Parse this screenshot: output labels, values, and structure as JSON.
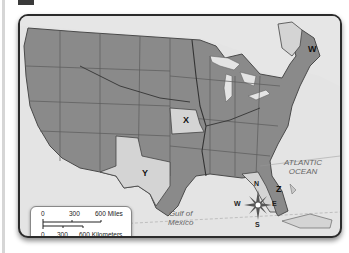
{
  "map": {
    "type": "political map of the United States",
    "region_labels": [
      {
        "id": "W",
        "label": "W",
        "state": "Maine"
      },
      {
        "id": "X",
        "label": "X",
        "state": "Missouri"
      },
      {
        "id": "Y",
        "label": "Y",
        "state": "Texas"
      },
      {
        "id": "Z",
        "label": "Z",
        "state": "Florida"
      }
    ],
    "water_labels": {
      "atlantic_line1": "ATLANTIC",
      "atlantic_line2": "OCEAN",
      "gulf_line1": "Gulf of",
      "gulf_line2": "Mexico"
    },
    "scale": {
      "miles": {
        "zero": "0",
        "mid": "300",
        "end": "600 Miles"
      },
      "km": {
        "zero": "0",
        "mid": "300",
        "end": "600 Kilometers"
      }
    },
    "compass": {
      "n": "N",
      "s": "S",
      "e": "E",
      "w": "W"
    },
    "colors": {
      "states": "#8a8a8a",
      "highlighted": "#d4d4d4",
      "water": "#e4e4e4",
      "borders": "#555555"
    }
  }
}
